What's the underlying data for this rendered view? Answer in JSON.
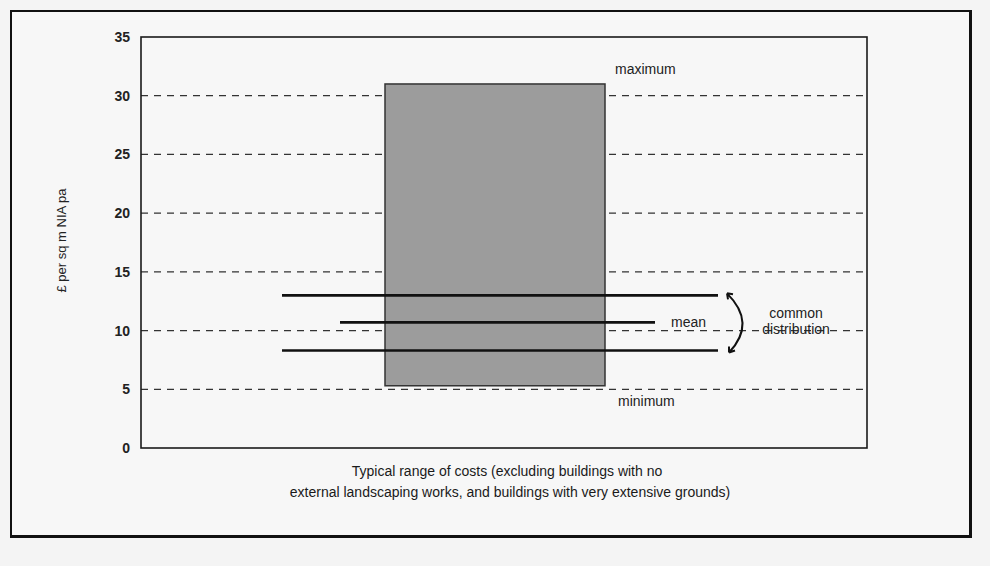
{
  "chart_data": {
    "type": "range-box",
    "title": "",
    "ylabel": "£ per sq m  NIA pa",
    "xlabel_lines": [
      "Typical range of costs (excluding buildings with no",
      "external landscaping works, and buildings with very extensive grounds)"
    ],
    "ylim": [
      0,
      35
    ],
    "yticks": [
      0,
      5,
      10,
      15,
      20,
      25,
      30,
      35
    ],
    "grid": "dashed horizontal at 5,10,15,20,25,30",
    "range": {
      "minimum": 5.3,
      "maximum": 31
    },
    "common_distribution": {
      "lower": 8.3,
      "upper": 13
    },
    "mean": 10.7,
    "annotations": {
      "maximum": "maximum",
      "minimum": "minimum",
      "mean": "mean",
      "common_distribution": [
        "common",
        "distribution"
      ]
    },
    "colors": {
      "box_fill": "#9c9c9c",
      "box_border": "#333333",
      "lines": "#111111",
      "grid": "#333333"
    }
  }
}
